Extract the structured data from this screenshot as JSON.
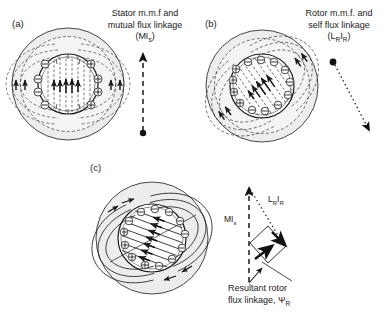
{
  "figure": {
    "type": "technical-diagram",
    "background_color": "#ffffff",
    "line_color": "#1a1a1a",
    "iron_fill": "#ededed"
  },
  "panels": [
    {
      "id": "a",
      "label": "(a)",
      "caption_lines": [
        "Stator m.m.f and",
        "mutual flux linkage"
      ],
      "quantity_symbol": "MI",
      "quantity_subscript": "s",
      "quantity_paren": "(MIs)",
      "flux_line_style": "dashed",
      "flux_axis_deg": 90,
      "arrow": {
        "name": "stator-mmf-arrow",
        "style": "dashed",
        "direction": "up",
        "origin_dot": true,
        "x1": 143,
        "y1": 133,
        "x2": 143,
        "y2": 52
      },
      "conductor_signs_left": [
        "minus",
        "minus",
        "minus"
      ],
      "conductor_signs_right": [
        "plus",
        "plus",
        "plus"
      ]
    },
    {
      "id": "b",
      "label": "(b)",
      "caption_lines": [
        "Rotor m.m.f. and",
        "self flux linkage"
      ],
      "quantity_symbol": "L",
      "quantity_subscript": "R",
      "quantity_paren": "(LRIR)",
      "flux_line_style": "dashed",
      "flux_axis_deg": 55,
      "arrow": {
        "name": "rotor-mmf-arrow",
        "style": "dotted",
        "direction": "down-right",
        "origin_dot": true,
        "x1": 333,
        "y1": 62,
        "x2": 370,
        "y2": 132
      },
      "conductor_signs_left": [
        "minus",
        "minus",
        "minus"
      ],
      "conductor_signs_right": [
        "plus",
        "plus",
        "plus"
      ]
    },
    {
      "id": "c",
      "label": "(c)",
      "caption_lines": [],
      "flux_line_style": "solid",
      "flux_axis_deg": 70,
      "conductor_signs_left": [
        "minus",
        "minus",
        "minus"
      ],
      "conductor_signs_right": [
        "plus",
        "plus",
        "plus"
      ]
    }
  ],
  "phasor_diagram": {
    "name": "resultant-flux-phasor-diagram",
    "vectors": [
      {
        "name": "stator-mmf-vector",
        "label": "MI",
        "subscript": "s",
        "style": "dashed",
        "direction": "up"
      },
      {
        "name": "rotor-self-flux-vector",
        "label": "LRIR",
        "base": "L",
        "subscript_1": "R",
        "mid": "I",
        "subscript_2": "R",
        "style": "dotted",
        "direction": "down-right"
      },
      {
        "name": "resultant-rotor-flux-vector",
        "label": "ΨR",
        "style": "solid-bold",
        "direction": "down-right"
      }
    ],
    "result_caption_lines": [
      "Resultant rotor",
      "flux linkage, ΨR"
    ],
    "result_symbol": "Ψ",
    "result_subscript": "R",
    "mi_label": "MI",
    "mi_subscript": "s",
    "lr_label": "L",
    "lr_sub1": "R",
    "lr_mid": "I",
    "lr_sub2": "R"
  }
}
